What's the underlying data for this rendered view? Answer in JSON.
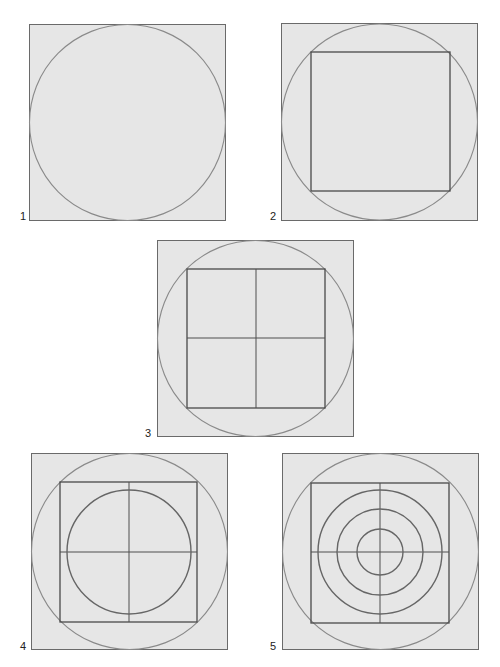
{
  "figure": {
    "background_color": "#ffffff",
    "panel_fill_color": "#e6e6e6",
    "panels": [
      {
        "id": "1",
        "label": "1",
        "description": "Circle inscribed in a square"
      },
      {
        "id": "2",
        "label": "2",
        "description": "Square inscribed in the circle"
      },
      {
        "id": "3",
        "label": "3",
        "description": "Inscribed square divided into quarters"
      },
      {
        "id": "4",
        "label": "4",
        "description": "Circle inscribed in the quartered square"
      },
      {
        "id": "5",
        "label": "5",
        "description": "Three concentric circles inside the quartered square"
      }
    ]
  }
}
